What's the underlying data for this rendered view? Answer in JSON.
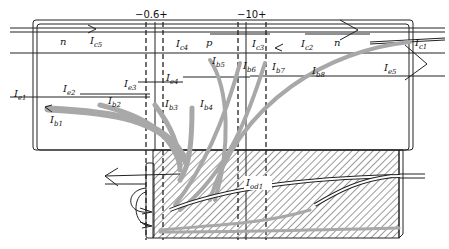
{
  "diagram": {
    "markers": [
      {
        "id": "marker-a",
        "text": "−0.6+"
      },
      {
        "id": "marker-b",
        "text": "−10+"
      }
    ],
    "regions": {
      "n_left": "n",
      "p": "p",
      "n_right": "n"
    },
    "currents": {
      "Ic5": {
        "main": "I",
        "sub": "c5"
      },
      "Ic4": {
        "main": "I",
        "sub": "c4"
      },
      "Ic3": {
        "main": "I",
        "sub": "c3"
      },
      "Ic2": {
        "main": "I",
        "sub": "c2"
      },
      "Ic1": {
        "main": "I",
        "sub": "c1"
      },
      "Ie1": {
        "main": "I",
        "sub": "e1"
      },
      "Ie2": {
        "main": "I",
        "sub": "e2"
      },
      "Ie3": {
        "main": "I",
        "sub": "e3"
      },
      "Ie4": {
        "main": "I",
        "sub": "e4"
      },
      "Ie5": {
        "main": "I",
        "sub": "e5"
      },
      "Ib1": {
        "main": "I",
        "sub": "b1"
      },
      "Ib2": {
        "main": "I",
        "sub": "b2"
      },
      "Ib3": {
        "main": "I",
        "sub": "b3"
      },
      "Ib4": {
        "main": "I",
        "sub": "b4"
      },
      "Ib5": {
        "main": "I",
        "sub": "b5"
      },
      "Ib6": {
        "main": "I",
        "sub": "b6"
      },
      "Ib7": {
        "main": "I",
        "sub": "b7"
      },
      "Ib8": {
        "main": "I",
        "sub": "b8"
      },
      "Iod1": {
        "main": "I",
        "sub": "od1"
      }
    },
    "colors": {
      "line": "#222222",
      "flow": "#a8a8a8",
      "hatch": "#333333",
      "background": "#ffffff"
    }
  }
}
